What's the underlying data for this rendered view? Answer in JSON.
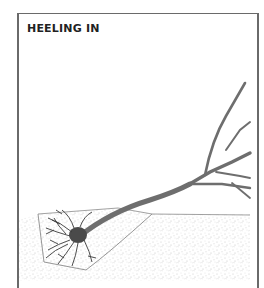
{
  "figure": {
    "title": "HEELING IN",
    "colors": {
      "frame": "#6a6a6a",
      "title": "#222222",
      "branch": "#707070",
      "roots": "#3a3a3a",
      "soil_speckle": "#b8b8b8"
    }
  }
}
